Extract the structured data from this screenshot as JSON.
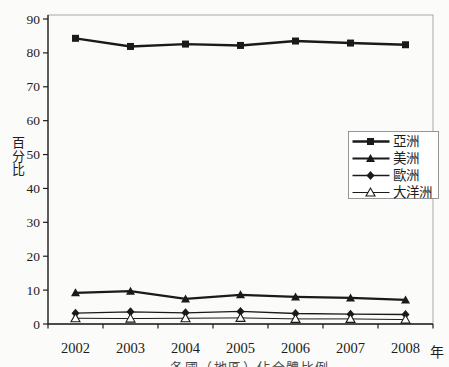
{
  "figure": {
    "ylabel": "百分比",
    "xlabel": "年",
    "caption_cropped": "各國（地區）佔全體比例"
  },
  "chart_data": {
    "type": "line",
    "title": "",
    "xlabel": "年",
    "ylabel": "百分比",
    "ylim": [
      0,
      90
    ],
    "yticks": [
      0,
      10,
      20,
      30,
      40,
      50,
      60,
      70,
      80,
      90
    ],
    "grid": false,
    "legend_position": "center-right",
    "categories": [
      "2002",
      "2003",
      "2004",
      "2005",
      "2006",
      "2007",
      "2008"
    ],
    "series": [
      {
        "name": "亞洲",
        "slug": "asia",
        "marker": "square-filled",
        "line_width": 2.4,
        "values": [
          84.3,
          81.9,
          82.6,
          82.2,
          83.5,
          82.9,
          82.4
        ]
      },
      {
        "name": "美洲",
        "slug": "americas",
        "marker": "triangle-filled",
        "line_width": 2.2,
        "values": [
          9.2,
          9.7,
          7.4,
          8.6,
          8.0,
          7.7,
          7.1
        ]
      },
      {
        "name": "歐洲",
        "slug": "europe",
        "marker": "diamond-filled",
        "line_width": 1.3,
        "values": [
          3.2,
          3.6,
          3.3,
          3.7,
          3.1,
          2.9,
          2.8
        ]
      },
      {
        "name": "大洋洲",
        "slug": "oceania",
        "marker": "triangle-open",
        "line_width": 1.0,
        "values": [
          1.7,
          1.6,
          1.7,
          1.8,
          1.5,
          1.5,
          1.3
        ]
      }
    ],
    "colors": {
      "line": "#1a1a1a",
      "text": "#1c1c1c",
      "frame_gray": "#a8a8a8",
      "axis_black": "#1f1f1f",
      "legend_border": "#8c8c8c",
      "background": "#fbfbfa"
    }
  }
}
